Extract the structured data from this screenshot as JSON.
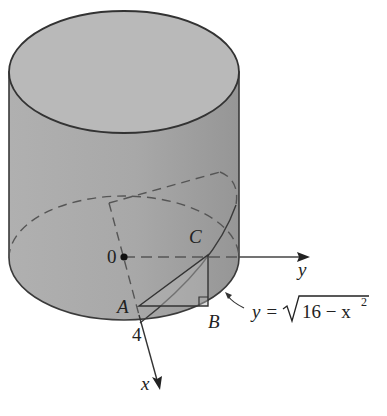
{
  "diagram": {
    "labels": {
      "origin": "0",
      "point_a": "A",
      "point_b": "B",
      "point_c": "C",
      "radius_value": "4",
      "x_axis": "x",
      "y_axis": "y",
      "equation_lhs": "y =",
      "equation_radicand": "16 − x",
      "equation_exponent": "2"
    },
    "colors": {
      "cylinder_top": "#b7b7b7",
      "cylinder_side": "#a9a9a9",
      "cylinder_side_dark": "#9a9a9a",
      "outline": "#3a3a3a",
      "dashed": "#555555",
      "text": "#222222"
    }
  }
}
